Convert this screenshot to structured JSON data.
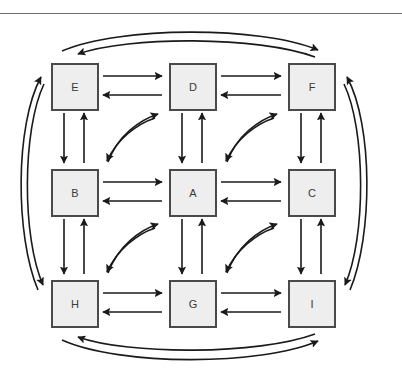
{
  "figure": {
    "width": 402,
    "height": 373,
    "background_color": "#ffffff",
    "top_rule_color": "#6e6e6e"
  },
  "style": {
    "node_fill": "#eeeeee",
    "node_stroke": "#4a4a4a",
    "node_stroke_width": 2,
    "arrow_color": "#1a1a1a",
    "arrow_stroke_width": 1.6,
    "label_color": "#3a3a3a",
    "label_font_size": 11
  },
  "nodes": [
    {
      "id": "E",
      "label": "E",
      "row": 0,
      "col": 0,
      "x": 51,
      "y": 63
    },
    {
      "id": "D",
      "label": "D",
      "row": 0,
      "col": 1,
      "x": 169,
      "y": 63
    },
    {
      "id": "F",
      "label": "F",
      "row": 0,
      "col": 2,
      "x": 288,
      "y": 63
    },
    {
      "id": "B",
      "label": "B",
      "row": 1,
      "col": 0,
      "x": 51,
      "y": 169
    },
    {
      "id": "A",
      "label": "A",
      "row": 1,
      "col": 1,
      "x": 169,
      "y": 169
    },
    {
      "id": "C",
      "label": "C",
      "row": 1,
      "col": 2,
      "x": 288,
      "y": 169
    },
    {
      "id": "H",
      "label": "H",
      "row": 2,
      "col": 0,
      "x": 51,
      "y": 280
    },
    {
      "id": "G",
      "label": "G",
      "row": 2,
      "col": 1,
      "x": 169,
      "y": 280
    },
    {
      "id": "I",
      "label": "I",
      "row": 2,
      "col": 2,
      "x": 288,
      "y": 280
    }
  ],
  "edges": {
    "horizontal_pairs": [
      {
        "from": "E",
        "to": "D",
        "bidirectional": true
      },
      {
        "from": "D",
        "to": "F",
        "bidirectional": true
      },
      {
        "from": "B",
        "to": "A",
        "bidirectional": true
      },
      {
        "from": "A",
        "to": "C",
        "bidirectional": true
      },
      {
        "from": "H",
        "to": "G",
        "bidirectional": true
      },
      {
        "from": "G",
        "to": "I",
        "bidirectional": true
      }
    ],
    "vertical_pairs": [
      {
        "from": "E",
        "to": "B",
        "bidirectional": true
      },
      {
        "from": "D",
        "to": "A",
        "bidirectional": true
      },
      {
        "from": "F",
        "to": "C",
        "bidirectional": true
      },
      {
        "from": "B",
        "to": "H",
        "bidirectional": true
      },
      {
        "from": "A",
        "to": "G",
        "bidirectional": true
      },
      {
        "from": "C",
        "to": "I",
        "bidirectional": true
      }
    ],
    "diagonal_curved_pairs": [
      {
        "from": "B",
        "to": "D",
        "bidirectional": true
      },
      {
        "from": "A",
        "to": "F",
        "bidirectional": true
      },
      {
        "from": "H",
        "to": "D",
        "bidirectional": false
      },
      {
        "from": "H",
        "to": "A",
        "bidirectional": true
      },
      {
        "from": "G",
        "to": "C",
        "bidirectional": true
      }
    ],
    "outer_arcs": [
      {
        "side": "top",
        "from": "E",
        "to": "F",
        "direction": "right"
      },
      {
        "side": "top",
        "from": "F",
        "to": "E",
        "direction": "left"
      },
      {
        "side": "left",
        "from": "H",
        "to": "E",
        "direction": "up"
      },
      {
        "side": "left",
        "from": "E",
        "to": "H",
        "direction": "down"
      },
      {
        "side": "right",
        "from": "I",
        "to": "F",
        "direction": "up"
      },
      {
        "side": "right",
        "from": "F",
        "to": "I",
        "direction": "down"
      },
      {
        "side": "bottom",
        "from": "I",
        "to": "H",
        "direction": "left"
      },
      {
        "side": "bottom",
        "from": "H",
        "to": "I",
        "direction": "right"
      }
    ]
  }
}
